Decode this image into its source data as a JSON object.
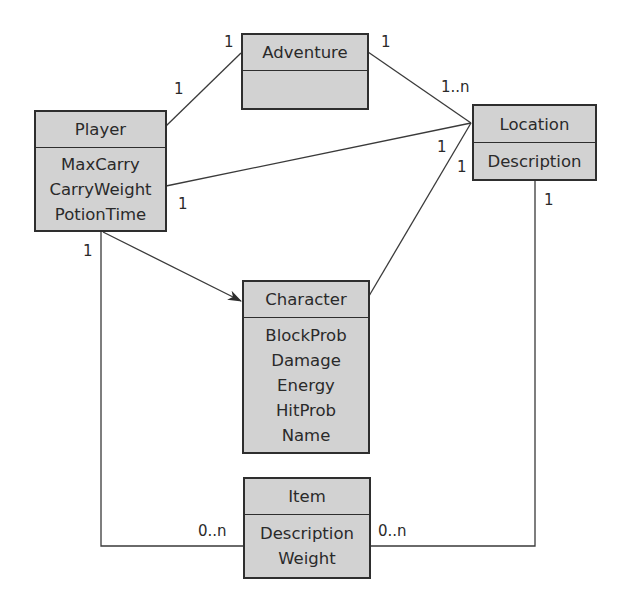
{
  "diagram": {
    "classes": {
      "player": {
        "name": "Player",
        "attributes": [
          "MaxCarry",
          "CarryWeight",
          "PotionTime"
        ]
      },
      "adventure": {
        "name": "Adventure",
        "attributes": []
      },
      "location": {
        "name": "Location",
        "attributes": [
          "Description"
        ]
      },
      "character": {
        "name": "Character",
        "attributes": [
          "BlockProb",
          "Damage",
          "Energy",
          "HitProb",
          "Name"
        ]
      },
      "item": {
        "name": "Item",
        "attributes": [
          "Description",
          "Weight"
        ]
      }
    },
    "multiplicities": {
      "player_adventure_at_player": "1",
      "player_adventure_at_adventure": "1",
      "adventure_location_at_adventure": "1",
      "adventure_location_at_location": "1..n",
      "player_location_at_player": "1",
      "player_location_at_location": "1",
      "character_location_at_location": "1",
      "location_item_at_location": "1",
      "player_item_at_player": "1",
      "player_item_at_item": "0..n",
      "location_item_at_item": "0..n"
    },
    "colors": {
      "box_fill": "#d2d2d2",
      "stroke": "#2e2e2e"
    }
  }
}
